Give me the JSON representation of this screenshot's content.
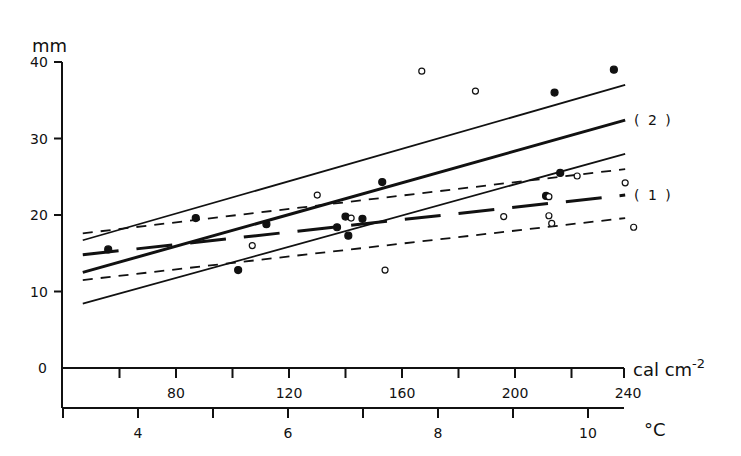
{
  "chart_data": {
    "type": "scatter",
    "title": "",
    "ylabel": "mm",
    "ylim": [
      0,
      40
    ],
    "yticks": [
      0,
      10,
      20,
      30,
      40
    ],
    "xaxes": [
      {
        "label": "cal cm⁻²",
        "ticks_labeled": [
          80,
          120,
          160,
          200,
          240
        ],
        "ticks_minor": [
          60,
          100,
          140,
          180,
          220
        ],
        "range": [
          40,
          240
        ]
      },
      {
        "label": "°C",
        "ticks_labeled": [
          4,
          6,
          8,
          10
        ],
        "ticks_minor": [
          3,
          5,
          7,
          9
        ]
      }
    ],
    "grid": false,
    "series": [
      {
        "name": "filled points",
        "marker": "filled-circle",
        "points": [
          [
            56,
            15.5
          ],
          [
            87,
            19.6
          ],
          [
            102,
            12.8
          ],
          [
            112,
            18.8
          ],
          [
            137,
            18.4
          ],
          [
            140,
            19.8
          ],
          [
            141,
            17.3
          ],
          [
            146,
            19.5
          ],
          [
            153,
            24.3
          ],
          [
            211,
            22.5
          ],
          [
            214,
            36.0
          ],
          [
            216,
            25.5
          ],
          [
            235,
            39.0
          ]
        ]
      },
      {
        "name": "open points",
        "marker": "open-circle",
        "points": [
          [
            107,
            16.0
          ],
          [
            130,
            22.6
          ],
          [
            142,
            19.6
          ],
          [
            154,
            12.8
          ],
          [
            167,
            38.8
          ],
          [
            186,
            36.2
          ],
          [
            196,
            19.8
          ],
          [
            212,
            22.4
          ],
          [
            212,
            19.9
          ],
          [
            213,
            18.9
          ],
          [
            222,
            25.1
          ],
          [
            239,
            24.2
          ],
          [
            242,
            18.4
          ]
        ]
      },
      {
        "name": "(2)",
        "style": "heavy-solid",
        "line": [
          [
            47,
            12.5
          ],
          [
            239,
            32.4
          ]
        ]
      },
      {
        "name": "(2) upper bound",
        "style": "thin-solid",
        "line": [
          [
            47,
            16.7
          ],
          [
            239,
            37.0
          ]
        ]
      },
      {
        "name": "(2) lower bound",
        "style": "thin-solid",
        "line": [
          [
            47,
            8.4
          ],
          [
            239,
            28.0
          ]
        ]
      },
      {
        "name": "(1)",
        "style": "heavy-long-dash",
        "line": [
          [
            47,
            14.8
          ],
          [
            239,
            22.6
          ]
        ]
      },
      {
        "name": "(1) upper bound",
        "style": "short-dash",
        "line": [
          [
            47,
            17.6
          ],
          [
            239,
            26.0
          ]
        ]
      },
      {
        "name": "(1) lower bound",
        "style": "short-dash",
        "line": [
          [
            47,
            11.5
          ],
          [
            239,
            19.6
          ]
        ]
      }
    ],
    "annotations": [
      "(1)",
      "(2)"
    ]
  },
  "labels": {
    "y_unit": "mm",
    "y_ticks": [
      "0",
      "10",
      "20",
      "30",
      "40"
    ],
    "cal_ticks": [
      "80",
      "120",
      "160",
      "200",
      "240"
    ],
    "cal_unit": "cal cm",
    "cal_unit_exp": "-2",
    "temp_ticks": [
      "4",
      "6",
      "8",
      "10"
    ],
    "temp_unit": "°C",
    "series1": "( 1 )",
    "series2": "( 2 )"
  }
}
